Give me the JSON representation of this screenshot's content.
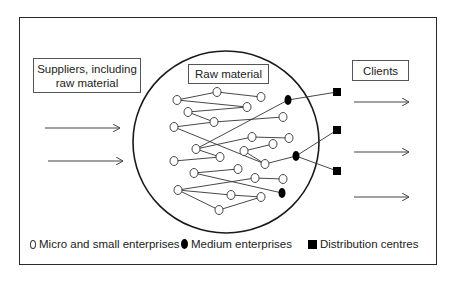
{
  "diagram": {
    "boxes": {
      "suppliers": "Suppliers, including raw material",
      "raw_material": "Raw material",
      "clients": "Clients"
    },
    "legend": [
      {
        "symbol": "open-circle",
        "label": "Micro and small enterprises"
      },
      {
        "symbol": "filled-circle",
        "label": "Medium enterprises"
      },
      {
        "symbol": "filled-square",
        "label": "Distribution centres"
      }
    ],
    "colors": {
      "stroke": "#2a2a2a",
      "fill_dark": "#000000",
      "background": "#ffffff"
    },
    "inbound_arrows": 2,
    "outbound_arrows": 3,
    "nodes": {
      "micro_small": [
        {
          "id": "a1",
          "x": 177,
          "y": 100
        },
        {
          "id": "a2",
          "x": 217,
          "y": 92
        },
        {
          "id": "a3",
          "x": 261,
          "y": 97
        },
        {
          "id": "a4",
          "x": 188,
          "y": 112
        },
        {
          "id": "a5",
          "x": 247,
          "y": 107
        },
        {
          "id": "a6",
          "x": 214,
          "y": 122
        },
        {
          "id": "a7",
          "x": 174,
          "y": 127
        },
        {
          "id": "a8",
          "x": 283,
          "y": 117
        },
        {
          "id": "a9",
          "x": 252,
          "y": 137
        },
        {
          "id": "a10",
          "x": 289,
          "y": 138
        },
        {
          "id": "a11",
          "x": 273,
          "y": 144
        },
        {
          "id": "a12",
          "x": 196,
          "y": 149
        },
        {
          "id": "a13",
          "x": 244,
          "y": 151
        },
        {
          "id": "a14",
          "x": 220,
          "y": 157
        },
        {
          "id": "a15",
          "x": 174,
          "y": 161
        },
        {
          "id": "a16",
          "x": 265,
          "y": 164
        },
        {
          "id": "a17",
          "x": 194,
          "y": 173
        },
        {
          "id": "a18",
          "x": 238,
          "y": 169
        },
        {
          "id": "a19",
          "x": 255,
          "y": 178
        },
        {
          "id": "a20",
          "x": 283,
          "y": 179
        },
        {
          "id": "a21",
          "x": 178,
          "y": 190
        },
        {
          "id": "a22",
          "x": 231,
          "y": 195
        },
        {
          "id": "a23",
          "x": 261,
          "y": 197
        },
        {
          "id": "a24",
          "x": 219,
          "y": 210
        }
      ],
      "medium": [
        {
          "id": "m1",
          "x": 288,
          "y": 100
        },
        {
          "id": "m2",
          "x": 296,
          "y": 156
        },
        {
          "id": "m3",
          "x": 282,
          "y": 193
        }
      ],
      "distribution": [
        {
          "id": "d1",
          "x": 337,
          "y": 92
        },
        {
          "id": "d2",
          "x": 337,
          "y": 130
        },
        {
          "id": "d3",
          "x": 337,
          "y": 171
        }
      ]
    },
    "edges": [
      [
        "a1",
        "a2"
      ],
      [
        "a2",
        "a3"
      ],
      [
        "a1",
        "a5"
      ],
      [
        "a4",
        "a5"
      ],
      [
        "a4",
        "a6"
      ],
      [
        "a6",
        "a8"
      ],
      [
        "a7",
        "a6"
      ],
      [
        "a7",
        "a16"
      ],
      [
        "a12",
        "m1"
      ],
      [
        "a12",
        "a9"
      ],
      [
        "a12",
        "a14"
      ],
      [
        "a9",
        "a10"
      ],
      [
        "a13",
        "a11"
      ],
      [
        "a13",
        "a16"
      ],
      [
        "a15",
        "a14"
      ],
      [
        "a16",
        "m2"
      ],
      [
        "a17",
        "a18"
      ],
      [
        "a17",
        "m3"
      ],
      [
        "a19",
        "a20"
      ],
      [
        "a21",
        "a19"
      ],
      [
        "a21",
        "a22"
      ],
      [
        "a21",
        "a24"
      ],
      [
        "a22",
        "a23"
      ],
      [
        "a24",
        "a23"
      ],
      [
        "m1",
        "d1"
      ],
      [
        "m2",
        "d2"
      ],
      [
        "m2",
        "d3"
      ]
    ]
  }
}
